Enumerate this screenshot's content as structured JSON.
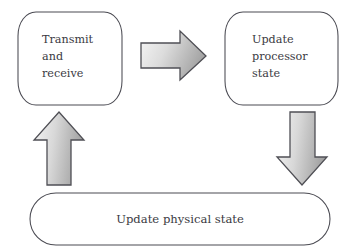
{
  "diagram": {
    "background_color": "#ffffff",
    "stroke_color": "#4a4a52",
    "text_color": "#3a3a42",
    "arrow_gradient_light": "#f2f2f2",
    "arrow_gradient_dark": "#a8a8a8",
    "arrow_outline_color": "#4f4f55",
    "nodes": [
      {
        "id": "transmit-and-receive",
        "shape": "barrel",
        "lines": [
          "Transmit",
          "and",
          "receive"
        ],
        "align": "left"
      },
      {
        "id": "update-processor-state",
        "shape": "barrel",
        "lines": [
          "Update",
          "processor",
          "state"
        ],
        "align": "left"
      },
      {
        "id": "update-physical-state",
        "shape": "stadium",
        "lines": [
          "Update physical state"
        ],
        "align": "center"
      }
    ],
    "arrows": [
      {
        "id": "transmit-to-processor",
        "direction": "right",
        "from": "transmit-and-receive",
        "to": "update-processor-state"
      },
      {
        "id": "processor-to-physical",
        "direction": "down",
        "from": "update-processor-state",
        "to": "update-physical-state"
      },
      {
        "id": "physical-to-transmit",
        "direction": "up",
        "from": "update-physical-state",
        "to": "transmit-and-receive"
      }
    ]
  }
}
